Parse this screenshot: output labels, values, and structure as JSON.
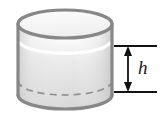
{
  "figure": {
    "name": "cylinder-height-diagram",
    "kind": "geometry-illustration",
    "background_color": "#ffffff"
  },
  "labels": {
    "height_label": "h"
  },
  "shape": {
    "name": "cylinder",
    "outline_color": "#8a8a8a",
    "outline_dark_color": "#767676",
    "body_fill_top": "#f4f4f4",
    "body_fill_bottom": "#d8d8d8",
    "top_face_fill": "#fbfbfb",
    "highlight_color": "#ffffff",
    "hidden_edge_color": "#909090",
    "hidden_edge_style": "dashed",
    "stroke_width": 3.2,
    "top_ellipse": {
      "cx": 65,
      "cy": 24,
      "rx": 47,
      "ry": 14
    },
    "bottom_ellipse": {
      "cx": 65,
      "cy": 95,
      "rx": 47,
      "ry": 14
    },
    "left_wall_x": 18,
    "right_wall_x": 112
  },
  "dimension": {
    "name": "height-dimension",
    "line_color": "#111111",
    "arrow_color": "#111111",
    "shaft_x": 128,
    "top_y": 46,
    "bottom_y": 92,
    "tick_left_x": 114,
    "tick_right_x": 157,
    "measures": "h"
  }
}
